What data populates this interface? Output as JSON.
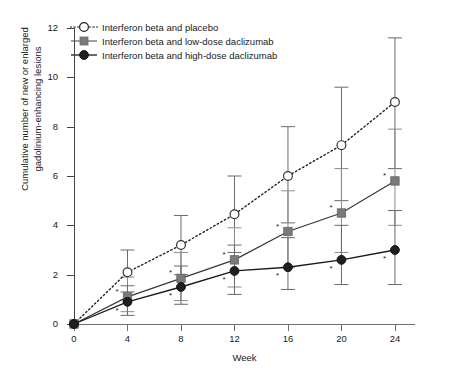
{
  "figure": {
    "xlabel": "Week",
    "ylabel_line1": "Cumulative number of new or enlarged",
    "ylabel_line2": "gadolinium-enhancing lesions"
  },
  "legend": {
    "items": [
      {
        "label": "Interferon beta and placebo",
        "marker": "open-circle-marker",
        "line": "dotted",
        "color": "#222222"
      },
      {
        "label": "Interferon beta and low-dose daclizumab",
        "marker": "gray-square-marker",
        "line": "solid",
        "color": "#7a7a7a"
      },
      {
        "label": "Interferon beta and high-dose daclizumab",
        "marker": "black-circle-marker",
        "line": "solid",
        "color": "#1a1a1a"
      }
    ]
  },
  "axes": {
    "y_ticks": [
      "12",
      "10",
      "8",
      "6",
      "4",
      "2",
      "0"
    ],
    "x_ticks": [
      "0",
      "4",
      "8",
      "12",
      "16",
      "20",
      "24"
    ]
  },
  "significance_marker": "*",
  "chart_data": {
    "type": "line",
    "title": "",
    "xlabel": "Week",
    "ylabel": "Cumulative number of new or enlarged gadolinium-enhancing lesions",
    "x": [
      0,
      4,
      8,
      12,
      16,
      20,
      24
    ],
    "xlim": [
      0,
      25.5
    ],
    "ylim": [
      0,
      12
    ],
    "yticks": [
      0,
      2,
      4,
      6,
      8,
      10,
      12
    ],
    "xticks": [
      0,
      4,
      8,
      12,
      16,
      20,
      24
    ],
    "grid": false,
    "legend_position": "top-left",
    "errorbars": true,
    "series": [
      {
        "name": "Interferon beta and placebo",
        "marker": "open-circle",
        "linestyle": "dotted",
        "color": "#222222",
        "values": [
          0,
          2.1,
          3.2,
          4.45,
          6.0,
          7.25,
          9.0
        ],
        "err_low": [
          0,
          1.3,
          2.0,
          2.9,
          4.1,
          5.0,
          6.3
        ],
        "err_high": [
          0,
          3.0,
          4.4,
          6.0,
          8.0,
          9.6,
          11.6
        ],
        "significance": [
          false,
          false,
          false,
          false,
          false,
          false,
          false
        ]
      },
      {
        "name": "Interferon beta and low-dose daclizumab",
        "marker": "gray-square",
        "linestyle": "solid",
        "color": "#7a7a7a",
        "values": [
          0,
          1.1,
          1.85,
          2.6,
          3.75,
          4.5,
          5.8
        ],
        "err_low": [
          0,
          0.5,
          0.95,
          1.5,
          2.3,
          2.9,
          4.0
        ],
        "err_high": [
          0,
          1.9,
          2.9,
          3.9,
          5.4,
          6.3,
          7.9
        ],
        "significance": [
          false,
          true,
          true,
          true,
          true,
          true,
          true
        ]
      },
      {
        "name": "Interferon beta and high-dose daclizumab",
        "marker": "black-circle",
        "linestyle": "solid",
        "color": "#1a1a1a",
        "values": [
          0,
          0.9,
          1.5,
          2.15,
          2.3,
          2.6,
          3.0
        ],
        "err_low": [
          0,
          0.35,
          0.8,
          1.2,
          1.4,
          1.6,
          1.6
        ],
        "err_high": [
          0,
          1.55,
          2.35,
          3.2,
          3.5,
          4.0,
          4.6
        ],
        "significance": [
          false,
          true,
          true,
          true,
          true,
          true,
          true
        ]
      }
    ]
  }
}
